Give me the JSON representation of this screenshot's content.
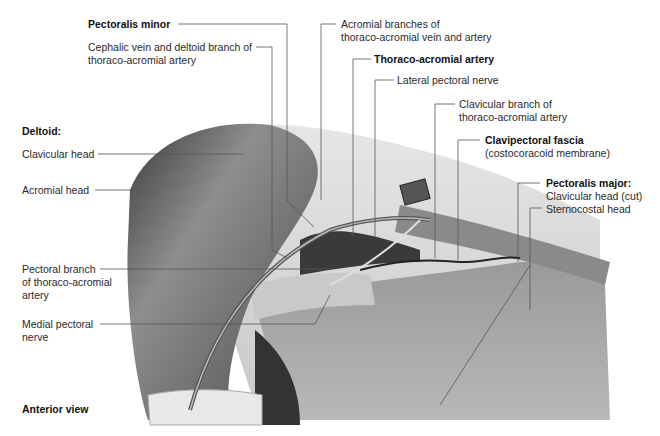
{
  "figure": {
    "view_label": "Anterior view",
    "labels": {
      "pectoralis_minor": "Pectoralis minor",
      "cephalic_vein_1": "Cephalic vein and deltoid branch of",
      "cephalic_vein_2": "thoraco-acromial artery",
      "acromial_branches_1": "Acromial branches of",
      "acromial_branches_2": "thoraco-acromial vein and artery",
      "thoraco_acromial_artery": "Thoraco-acromial artery",
      "lateral_pectoral_nerve": "Lateral pectoral nerve",
      "clavicular_branch_1": "Clavicular branch of",
      "clavicular_branch_2": "thoraco-acromial artery",
      "clavipectoral_fascia": "Clavipectoral fascia",
      "costocoracoid_membrane": "(costocoracoid membrane)",
      "pectoralis_major": "Pectoralis major:",
      "clavicular_head_cut": "Clavicular head (cut)",
      "sternocostal_head": "Sternocostal head",
      "deltoid": "Deltoid:",
      "deltoid_clavicular_head": "Clavicular head",
      "deltoid_acromial_head": "Acromial head",
      "pectoral_branch_1": "Pectoral branch",
      "pectoral_branch_2": "of thoraco-acromial",
      "pectoral_branch_3": "artery",
      "medial_pectoral_1": "Medial pectoral",
      "medial_pectoral_2": "nerve"
    }
  }
}
